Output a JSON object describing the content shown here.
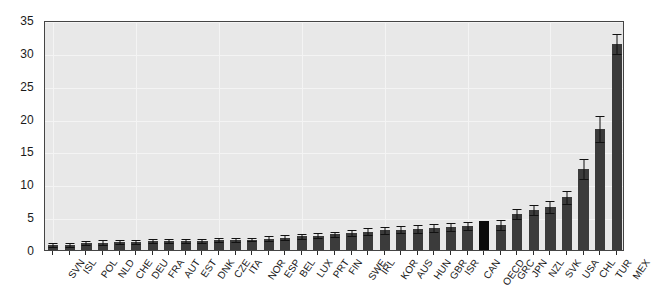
{
  "chart_data": {
    "type": "bar",
    "title": "",
    "subtitle": "",
    "xlabel": "",
    "ylabel": "",
    "ylim": [
      0,
      35
    ],
    "yticks": [
      0,
      5,
      10,
      15,
      20,
      25,
      30,
      35
    ],
    "ytick_labels": [
      "0",
      "5",
      "10",
      "15",
      "20",
      "25",
      "30",
      "35"
    ],
    "grid": true,
    "legend": "none",
    "bar_color": "#3b3b3b",
    "highlight_color": "#0b0b0b",
    "highlight_category": "OECD",
    "plot_background": "#e8e8e8",
    "error_bars": true,
    "categories": [
      "SVN",
      "ISL",
      "POL",
      "NLD",
      "CHE",
      "DEU",
      "FRA",
      "AUT",
      "EST",
      "DNK",
      "CZE",
      "ITA",
      "NOR",
      "ESP",
      "BEL",
      "LUX",
      "PRT",
      "FIN",
      "SWE",
      "IRL",
      "KOR",
      "AUS",
      "HUN",
      "GBR",
      "ISR",
      "CAN",
      "OECD",
      "GRC",
      "JPN",
      "NZL",
      "SVK",
      "USA",
      "CHL",
      "TUR",
      "MEX"
    ],
    "values": [
      0.7,
      0.8,
      1.0,
      1.1,
      1.2,
      1.2,
      1.3,
      1.3,
      1.4,
      1.4,
      1.5,
      1.5,
      1.6,
      1.7,
      1.9,
      2.1,
      2.2,
      2.4,
      2.6,
      2.8,
      3.0,
      3.1,
      3.2,
      3.3,
      3.5,
      3.6,
      4.4,
      3.8,
      5.5,
      6.1,
      6.6,
      8.0,
      12.3,
      18.4,
      31.3
    ],
    "errors": [
      0.3,
      0.3,
      0.3,
      0.4,
      0.3,
      0.3,
      0.3,
      0.3,
      0.3,
      0.3,
      0.3,
      0.3,
      0.3,
      0.4,
      0.4,
      0.4,
      0.4,
      0.4,
      0.5,
      0.5,
      0.5,
      0.5,
      0.6,
      0.6,
      0.6,
      0.6,
      0.0,
      0.8,
      0.8,
      0.8,
      0.9,
      1.0,
      1.5,
      2.0,
      1.5
    ]
  }
}
